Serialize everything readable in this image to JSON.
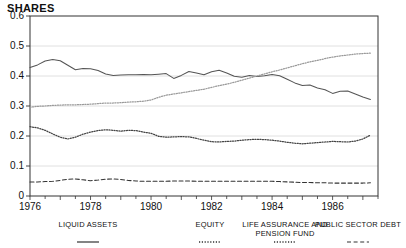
{
  "chart_data": {
    "type": "line",
    "title": "SHARES",
    "xlabel": "",
    "ylabel": "",
    "ylim": [
      0,
      0.6
    ],
    "xlim": [
      1976.0,
      1987.5
    ],
    "grid": true,
    "grid_axis": "y",
    "legend_position": "below",
    "yticks": [
      0,
      0.1,
      0.2,
      0.3,
      0.4,
      0.5,
      0.6
    ],
    "ytick_labels": [
      "0",
      "0.1",
      "0.2",
      "0.3",
      "0.4",
      "0.5",
      "0.6"
    ],
    "xticks": [
      1976,
      1978,
      1980,
      1982,
      1984,
      1986
    ],
    "xtick_labels": [
      "1976",
      "1978",
      "1980",
      "1982",
      "1984",
      "1986"
    ],
    "minor_xticks_per_year": 2,
    "x": [
      1976.0,
      1976.25,
      1976.5,
      1976.75,
      1977.0,
      1977.25,
      1977.5,
      1977.75,
      1978.0,
      1978.25,
      1978.5,
      1978.75,
      1979.0,
      1979.25,
      1979.5,
      1979.75,
      1980.0,
      1980.25,
      1980.5,
      1980.75,
      1981.0,
      1981.25,
      1981.5,
      1981.75,
      1982.0,
      1982.25,
      1982.5,
      1982.75,
      1983.0,
      1983.25,
      1983.5,
      1983.75,
      1984.0,
      1984.25,
      1984.5,
      1984.75,
      1985.0,
      1985.25,
      1985.5,
      1985.75,
      1986.0,
      1986.25,
      1986.5,
      1986.75,
      1987.0,
      1987.25
    ],
    "series": [
      {
        "name": "LIQUID ASSETS",
        "style": "solid",
        "color": "#555555",
        "values": [
          0.428,
          0.437,
          0.45,
          0.455,
          0.451,
          0.436,
          0.421,
          0.425,
          0.424,
          0.418,
          0.407,
          0.402,
          0.403,
          0.404,
          0.404,
          0.405,
          0.404,
          0.406,
          0.408,
          0.392,
          0.402,
          0.415,
          0.41,
          0.404,
          0.414,
          0.419,
          0.41,
          0.399,
          0.396,
          0.402,
          0.398,
          0.401,
          0.405,
          0.401,
          0.389,
          0.377,
          0.368,
          0.37,
          0.36,
          0.354,
          0.342,
          0.349,
          0.35,
          0.34,
          0.33,
          0.322
        ]
      },
      {
        "name": "EQUITY",
        "style": "dotted",
        "color": "#9a9a9a",
        "values": [
          0.296,
          0.299,
          0.3,
          0.302,
          0.303,
          0.304,
          0.304,
          0.305,
          0.306,
          0.308,
          0.31,
          0.31,
          0.311,
          0.313,
          0.314,
          0.316,
          0.32,
          0.329,
          0.336,
          0.34,
          0.344,
          0.348,
          0.352,
          0.356,
          0.362,
          0.368,
          0.373,
          0.379,
          0.386,
          0.393,
          0.4,
          0.407,
          0.414,
          0.42,
          0.427,
          0.434,
          0.441,
          0.447,
          0.452,
          0.458,
          0.463,
          0.467,
          0.47,
          0.473,
          0.475,
          0.476
        ]
      },
      {
        "name": "LIFE ASSURANCE AND\nPENSION FUND",
        "style": "dotted",
        "color": "#444444",
        "values": [
          0.231,
          0.227,
          0.219,
          0.207,
          0.196,
          0.19,
          0.196,
          0.206,
          0.213,
          0.218,
          0.221,
          0.219,
          0.216,
          0.219,
          0.218,
          0.213,
          0.209,
          0.199,
          0.196,
          0.197,
          0.198,
          0.197,
          0.192,
          0.186,
          0.181,
          0.18,
          0.182,
          0.183,
          0.186,
          0.188,
          0.189,
          0.188,
          0.186,
          0.183,
          0.179,
          0.176,
          0.174,
          0.176,
          0.178,
          0.18,
          0.182,
          0.181,
          0.18,
          0.183,
          0.19,
          0.203
        ]
      },
      {
        "name": "PUBLIC SECTOR DEBT",
        "style": "dashed",
        "color": "#333333",
        "values": [
          0.047,
          0.047,
          0.048,
          0.049,
          0.052,
          0.056,
          0.057,
          0.054,
          0.051,
          0.053,
          0.056,
          0.057,
          0.055,
          0.052,
          0.05,
          0.049,
          0.049,
          0.049,
          0.049,
          0.05,
          0.05,
          0.05,
          0.049,
          0.049,
          0.049,
          0.049,
          0.049,
          0.049,
          0.049,
          0.049,
          0.049,
          0.049,
          0.049,
          0.048,
          0.047,
          0.046,
          0.045,
          0.045,
          0.044,
          0.044,
          0.043,
          0.043,
          0.043,
          0.043,
          0.043,
          0.044
        ]
      }
    ],
    "legend": [
      {
        "label": "LIQUID ASSETS",
        "style": "solid"
      },
      {
        "label": "EQUITY",
        "style": "dotted"
      },
      {
        "label": "LIFE ASSURANCE AND\nPENSION FUND",
        "style": "dotted"
      },
      {
        "label": "PUBLIC SECTOR DEBT",
        "style": "dashed"
      }
    ]
  }
}
